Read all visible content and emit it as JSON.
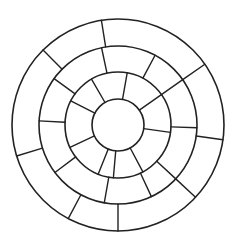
{
  "diagram": {
    "type": "segmented-concentric-rings",
    "canvas": {
      "width": 238,
      "height": 250,
      "background": "#ffffff"
    },
    "stroke_color": "#222222",
    "center": {
      "x": 118,
      "y": 125
    },
    "rings": [
      {
        "name": "inner-circle",
        "radius": 26
      },
      {
        "name": "ring-3",
        "radius": 53
      },
      {
        "name": "ring-2",
        "radius": 79
      },
      {
        "name": "outer-ring",
        "radius": 106
      }
    ],
    "bands": [
      {
        "name": "inner-band",
        "inner_radius": 26,
        "outer_radius": 53,
        "spoke_angles_deg": [
          8,
          62,
          95,
          112,
          155,
          207,
          240,
          280,
          325
        ]
      },
      {
        "name": "middle-band",
        "inner_radius": 53,
        "outer_radius": 79,
        "spoke_angles_deg": [
          2,
          43,
          65,
          100,
          143,
          183,
          216,
          258,
          298,
          325
        ]
      },
      {
        "name": "outer-band",
        "inner_radius": 79,
        "outer_radius": 106,
        "spoke_angles_deg": [
          8,
          43,
          90,
          118,
          163,
          225,
          261,
          325
        ]
      }
    ]
  }
}
